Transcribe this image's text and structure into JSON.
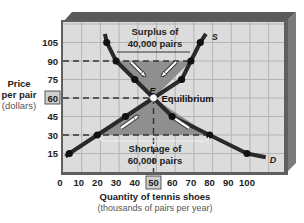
{
  "chart_data": {
    "type": "line",
    "title": "",
    "xlabel": "Quantity of tennis shoes",
    "xlabel_sub": "(thousands of pairs per year)",
    "ylabel_lines": [
      "Price",
      "per pair",
      "(dollars)"
    ],
    "x_ticks": [
      0,
      10,
      20,
      30,
      40,
      50,
      60,
      70,
      80,
      90,
      100
    ],
    "y_ticks": [
      15,
      30,
      45,
      60,
      75,
      90,
      105
    ],
    "highlighted_x_tick": 50,
    "highlighted_y_tick": 60,
    "xlim": [
      0,
      120
    ],
    "ylim": [
      0,
      120
    ],
    "grid": true,
    "series": [
      {
        "name": "S",
        "label": "S",
        "points": [
          [
            5,
            15
          ],
          [
            20,
            30
          ],
          [
            35,
            45
          ],
          [
            50,
            60
          ],
          [
            65,
            75
          ],
          [
            70,
            90
          ],
          [
            75,
            105
          ]
        ],
        "line_end": [
          78,
          112
        ]
      },
      {
        "name": "D",
        "label": "D",
        "points": [
          [
            25,
            105
          ],
          [
            30,
            90
          ],
          [
            40,
            75
          ],
          [
            50,
            60
          ],
          [
            60,
            45
          ],
          [
            80,
            30
          ],
          [
            100,
            15
          ]
        ],
        "line_start": [
          24,
          112
        ],
        "line_end": [
          110,
          12
        ]
      }
    ],
    "equilibrium": {
      "label": "E",
      "text": "Equilibrium",
      "quantity": 50,
      "price": 60
    },
    "surplus": {
      "price": 90,
      "qd": 30,
      "qs": 70,
      "text_line1": "Surplus of",
      "text_line2": "40,000 pairs"
    },
    "shortage": {
      "price": 30,
      "qd": 80,
      "qs": 20,
      "text_line1": "Shortage of",
      "text_line2": "60,000 pairs"
    },
    "colors": {
      "frame": "#6e6e6e",
      "frame_top": "#555555",
      "plot_bg": "#dcdcdc",
      "grid": "#b4b4b4",
      "curve": "#2a2a2a",
      "shade": "#8f8f8f",
      "dashed": "#333333"
    }
  }
}
